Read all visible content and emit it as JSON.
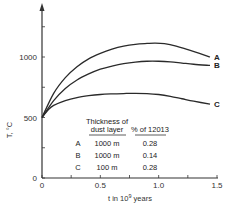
{
  "chart_data": {
    "type": "line",
    "title": "",
    "xlabel": "t in 10⁹ years",
    "xlabel_parts": {
      "base": "t in 10",
      "sup": "9",
      "tail": " years"
    },
    "ylabel": "T, °C",
    "xlim": [
      0,
      1.5
    ],
    "ylim": [
      0,
      1400
    ],
    "x_ticks": [
      0,
      0.25,
      0.5,
      0.75,
      1.0,
      1.25,
      1.5
    ],
    "x_tick_labels": [
      {
        "value": 0,
        "label": "0"
      },
      {
        "value": 0.5,
        "label": "0.5"
      },
      {
        "value": 1.0,
        "label": "1.0"
      },
      {
        "value": 1.5,
        "label": "1.5"
      }
    ],
    "y_ticks": [
      0,
      250,
      500,
      750,
      1000,
      1250
    ],
    "y_tick_labels": [
      {
        "value": 0,
        "label": "0"
      },
      {
        "value": 500,
        "label": "500"
      },
      {
        "value": 1000,
        "label": "1000"
      }
    ],
    "grid": false,
    "series": [
      {
        "name": "A",
        "points": [
          [
            0,
            500
          ],
          [
            0.1,
            700
          ],
          [
            0.2,
            830
          ],
          [
            0.3,
            920
          ],
          [
            0.4,
            985
          ],
          [
            0.5,
            1030
          ],
          [
            0.6,
            1065
          ],
          [
            0.7,
            1090
          ],
          [
            0.8,
            1105
          ],
          [
            0.9,
            1112
          ],
          [
            0.97,
            1115
          ],
          [
            1.05,
            1110
          ],
          [
            1.15,
            1090
          ],
          [
            1.25,
            1060
          ],
          [
            1.35,
            1030
          ],
          [
            1.44,
            1000
          ]
        ]
      },
      {
        "name": "B",
        "points": [
          [
            0,
            500
          ],
          [
            0.1,
            640
          ],
          [
            0.2,
            740
          ],
          [
            0.3,
            810
          ],
          [
            0.4,
            860
          ],
          [
            0.5,
            900
          ],
          [
            0.6,
            925
          ],
          [
            0.7,
            945
          ],
          [
            0.8,
            958
          ],
          [
            0.9,
            965
          ],
          [
            1.0,
            965
          ],
          [
            1.1,
            960
          ],
          [
            1.2,
            950
          ],
          [
            1.3,
            940
          ],
          [
            1.44,
            930
          ]
        ]
      },
      {
        "name": "C",
        "points": [
          [
            0,
            500
          ],
          [
            0.05,
            560
          ],
          [
            0.1,
            600
          ],
          [
            0.2,
            640
          ],
          [
            0.3,
            665
          ],
          [
            0.4,
            680
          ],
          [
            0.5,
            690
          ],
          [
            0.6,
            695
          ],
          [
            0.7,
            698
          ],
          [
            0.8,
            700
          ],
          [
            0.9,
            698
          ],
          [
            1.0,
            690
          ],
          [
            1.1,
            675
          ],
          [
            1.2,
            655
          ],
          [
            1.3,
            635
          ],
          [
            1.44,
            610
          ]
        ]
      }
    ],
    "legend_table": {
      "headers": [
        "",
        "Thickness of dust layer",
        "% of 12013"
      ],
      "header_line1": "Thickness of",
      "header_line2": "dust layer",
      "header_pct": "% of 12013",
      "rows": [
        {
          "label": "A",
          "thickness": "1000 m",
          "percent": "0.28"
        },
        {
          "label": "B",
          "thickness": "1000 m",
          "percent": "0.14"
        },
        {
          "label": "C",
          "thickness": "100 m",
          "percent": "0.28"
        }
      ]
    }
  }
}
